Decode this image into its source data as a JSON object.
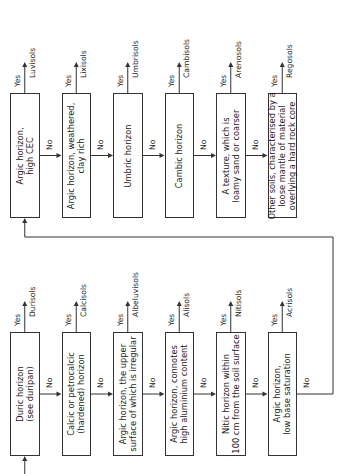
{
  "colors": {
    "line": "#333333",
    "text": "#1a1a1a",
    "background": "#ffffff"
  },
  "labels": {
    "yes": "Yes",
    "no": "No"
  },
  "bottom_row": [
    {
      "question": "Duric horizon\n(see duripan)",
      "outcome": "Durisols"
    },
    {
      "question": "Calcic or petrocalcic\n(hardened) horizon",
      "outcome": "Calcisols"
    },
    {
      "question": "Argic horizon, the upper\nsurface of which is irregular",
      "outcome": "Albeluvisols"
    },
    {
      "question": "Argic horizon, connotes\nhigh aluminium content",
      "outcome": "Alisols"
    },
    {
      "question": "Nitic horizon within\n100 cm from the soil surface",
      "outcome": "Nitisols"
    },
    {
      "question": "Argic horizon,\nlow base saturation",
      "outcome": "Acrisols"
    }
  ],
  "top_row": [
    {
      "question": "Argic horizon,\nhigh CEC",
      "outcome": "Luvisols"
    },
    {
      "question": "Argic horizon, weathered,\nclay rich",
      "outcome": "Lixisols"
    },
    {
      "question": "Umbric horizon",
      "outcome": "Umbrisols"
    },
    {
      "question": "Cambic horizon",
      "outcome": "Cambisols"
    },
    {
      "question": "A texture, which is\nloamy sand or coarser",
      "outcome": "Arenosols"
    },
    {
      "question": "Other soils, characterised by a\nloose mantle of material\noverlying a hard rock core",
      "outcome": "Regosols"
    }
  ]
}
